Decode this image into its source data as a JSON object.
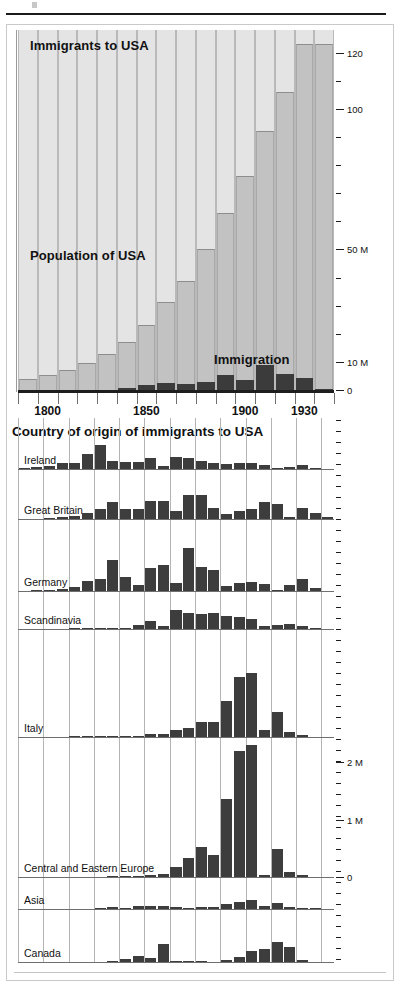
{
  "figure": {
    "top_panel": {
      "title_immigrants": "Immigrants to USA",
      "title_population": "Population of USA",
      "title_immigration": "Immigration"
    },
    "bottom_panel": {
      "title": "Country of origin of immigrants to USA"
    }
  },
  "chart_data": [
    {
      "type": "bar",
      "id": "population-and-immigration",
      "title": "Immigrants to USA",
      "annotations": [
        "Immigrants to USA",
        "Population of USA",
        "Immigration"
      ],
      "xlabel": "",
      "ylabel": "",
      "grid": true,
      "legend": "none",
      "x": [
        1790,
        1800,
        1810,
        1820,
        1830,
        1840,
        1850,
        1860,
        1870,
        1880,
        1890,
        1900,
        1910,
        1920,
        1930,
        1940
      ],
      "xtick_labels": [
        "1800",
        "1850",
        "1900",
        "1930"
      ],
      "xtick_values": [
        1800,
        1850,
        1900,
        1930
      ],
      "ylim": [
        0,
        128
      ],
      "ytick_labels": [
        "0",
        "10 M",
        "50 M",
        "100",
        "120"
      ],
      "ytick_values": [
        0,
        10,
        50,
        100,
        120
      ],
      "yminor_ticks": [
        20,
        30,
        40,
        60,
        70,
        80,
        90,
        110
      ],
      "series": [
        {
          "name": "Population of USA",
          "units": "millions",
          "color": "#c2c2c2",
          "values": [
            3.9,
            5.3,
            7.2,
            9.6,
            12.9,
            17.1,
            23.2,
            31.4,
            38.6,
            50.2,
            63.0,
            76.2,
            92.2,
            106.0,
            123.2,
            123.2
          ]
        },
        {
          "name": "Immigration",
          "units": "millions per decade",
          "color": "#3b3b3b",
          "values": [
            0.0,
            0.0,
            0.0,
            0.0,
            0.15,
            0.6,
            1.7,
            2.6,
            2.3,
            2.8,
            5.2,
            3.7,
            8.8,
            5.7,
            4.1,
            0.5
          ]
        }
      ]
    },
    {
      "type": "bar",
      "id": "country-of-origin",
      "title": "Country of origin of immigrants to USA",
      "xlabel": "",
      "ylabel": "",
      "grid": true,
      "legend": "row-labels",
      "x": [
        1820,
        1825,
        1830,
        1835,
        1840,
        1845,
        1850,
        1855,
        1860,
        1865,
        1870,
        1875,
        1880,
        1885,
        1890,
        1895,
        1900,
        1905,
        1910,
        1915,
        1920,
        1925,
        1930,
        1935,
        1940
      ],
      "ytick_labels": [
        "0",
        "1 M",
        "2 M"
      ],
      "ytick_values": [
        0,
        1,
        2
      ],
      "units": "immigrants per 5-year period (millions)",
      "bar_color": "#3d3d3d",
      "series": [
        {
          "name": "Ireland",
          "ymax": 1.0,
          "values": [
            0.01,
            0.04,
            0.06,
            0.13,
            0.13,
            0.3,
            0.48,
            0.16,
            0.15,
            0.15,
            0.22,
            0.06,
            0.25,
            0.23,
            0.17,
            0.13,
            0.11,
            0.13,
            0.12,
            0.09,
            0.03,
            0.05,
            0.09,
            0.01,
            0.0
          ]
        },
        {
          "name": "Great Britain",
          "ymax": 0.6,
          "values": [
            0.0,
            0.0,
            0.01,
            0.03,
            0.04,
            0.07,
            0.13,
            0.21,
            0.13,
            0.13,
            0.22,
            0.23,
            0.1,
            0.3,
            0.3,
            0.14,
            0.06,
            0.1,
            0.12,
            0.21,
            0.19,
            0.03,
            0.14,
            0.08,
            0.03
          ]
        },
        {
          "name": "Germany",
          "ymax": 1.2,
          "values": [
            0.0,
            0.01,
            0.02,
            0.04,
            0.07,
            0.17,
            0.21,
            0.54,
            0.24,
            0.11,
            0.4,
            0.44,
            0.14,
            0.74,
            0.41,
            0.36,
            0.09,
            0.13,
            0.16,
            0.12,
            0.02,
            0.1,
            0.21,
            0.05,
            0.0
          ]
        },
        {
          "name": "Scandinavia",
          "ymax": 0.5,
          "values": [
            0.0,
            0.0,
            0.0,
            0.0,
            0.01,
            0.01,
            0.01,
            0.01,
            0.02,
            0.05,
            0.11,
            0.04,
            0.26,
            0.22,
            0.21,
            0.22,
            0.18,
            0.17,
            0.14,
            0.04,
            0.06,
            0.07,
            0.04,
            0.01,
            0.0
          ]
        },
        {
          "name": "Italy",
          "ymax": 1.6,
          "values": [
            0.0,
            0.0,
            0.0,
            0.0,
            0.01,
            0.01,
            0.01,
            0.01,
            0.01,
            0.02,
            0.04,
            0.04,
            0.1,
            0.14,
            0.23,
            0.22,
            0.55,
            0.9,
            0.97,
            0.1,
            0.37,
            0.07,
            0.03,
            0.0,
            0.0
          ]
        },
        {
          "name": "Central and Eastern Europe",
          "ymax": 2.4,
          "values": [
            0.0,
            0.0,
            0.0,
            0.0,
            0.0,
            0.0,
            0.0,
            0.02,
            0.02,
            0.01,
            0.04,
            0.06,
            0.18,
            0.33,
            0.52,
            0.39,
            1.35,
            2.2,
            2.3,
            0.04,
            0.48,
            0.09,
            0.04,
            0.0,
            0.0
          ]
        },
        {
          "name": "Asia",
          "ymax": 0.35,
          "values": [
            0.0,
            0.0,
            0.0,
            0.0,
            0.0,
            0.0,
            0.01,
            0.02,
            0.01,
            0.03,
            0.04,
            0.03,
            0.02,
            0.01,
            0.02,
            0.02,
            0.06,
            0.08,
            0.1,
            0.04,
            0.07,
            0.02,
            0.01,
            0.01,
            0.0
          ]
        },
        {
          "name": "Canada",
          "ymax": 0.65,
          "values": [
            0.0,
            0.0,
            0.0,
            0.0,
            0.0,
            0.0,
            0.0,
            0.01,
            0.04,
            0.08,
            0.05,
            0.23,
            0.01,
            0.01,
            0.01,
            0.0,
            0.02,
            0.06,
            0.14,
            0.17,
            0.26,
            0.19,
            0.03,
            0.0,
            0.0
          ]
        }
      ]
    }
  ]
}
